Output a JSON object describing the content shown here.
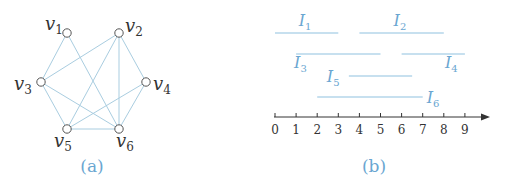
{
  "colors": {
    "edge": "#a9cde0",
    "interval": "#8fc1e0",
    "node_stroke": "#555555",
    "label": "#333333",
    "interval_label": "#6aa6d1",
    "caption": "#6aa6d1",
    "axis": "#333333"
  },
  "panel_a": {
    "caption": "(a)",
    "nodes": [
      {
        "id": "v1",
        "base": "v",
        "sub": "1",
        "x": 67,
        "y": 33
      },
      {
        "id": "v2",
        "base": "v",
        "sub": "2",
        "x": 119,
        "y": 33
      },
      {
        "id": "v3",
        "base": "v",
        "sub": "3",
        "x": 41,
        "y": 82
      },
      {
        "id": "v4",
        "base": "v",
        "sub": "4",
        "x": 146,
        "y": 82
      },
      {
        "id": "v5",
        "base": "v",
        "sub": "5",
        "x": 67,
        "y": 129
      },
      {
        "id": "v6",
        "base": "v",
        "sub": "6",
        "x": 119,
        "y": 129
      }
    ],
    "edges": [
      [
        "v1",
        "v3"
      ],
      [
        "v1",
        "v6"
      ],
      [
        "v2",
        "v3"
      ],
      [
        "v2",
        "v4"
      ],
      [
        "v2",
        "v5"
      ],
      [
        "v2",
        "v6"
      ],
      [
        "v3",
        "v5"
      ],
      [
        "v3",
        "v6"
      ],
      [
        "v4",
        "v5"
      ],
      [
        "v4",
        "v6"
      ],
      [
        "v5",
        "v6"
      ]
    ]
  },
  "panel_b": {
    "caption": "(b)",
    "axis": {
      "ticks": [
        "0",
        "1",
        "2",
        "3",
        "4",
        "5",
        "6",
        "7",
        "8",
        "9"
      ],
      "min": 0,
      "max": 9
    },
    "intervals": [
      {
        "name": "I",
        "sub": "1",
        "start": 0,
        "end": 3,
        "row": 0
      },
      {
        "name": "I",
        "sub": "2",
        "start": 4,
        "end": 8,
        "row": 0
      },
      {
        "name": "I",
        "sub": "3",
        "start": 1,
        "end": 5,
        "row": 1
      },
      {
        "name": "I",
        "sub": "4",
        "start": 6,
        "end": 9,
        "row": 1
      },
      {
        "name": "I",
        "sub": "5",
        "start": 3.5,
        "end": 6.5,
        "row": 2
      },
      {
        "name": "I",
        "sub": "6",
        "start": 2,
        "end": 7,
        "row": 3
      }
    ]
  }
}
